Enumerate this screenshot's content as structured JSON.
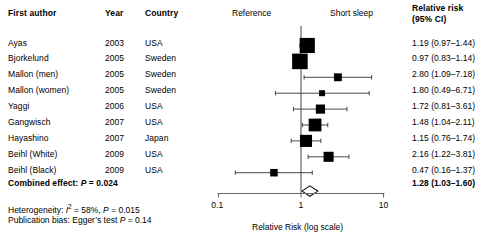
{
  "columns": {
    "author": "First author",
    "year": "Year",
    "country": "Country",
    "risk_line1": "Relative risk",
    "risk_line2": "(95% CI)"
  },
  "plot": {
    "left_label": "Reference",
    "right_label": "Short sleep",
    "axis_label": "Relative Risk (log scale)",
    "ticks": [
      "0.1",
      "1",
      "10"
    ],
    "null_value": 1
  },
  "rows": [
    {
      "author": "Ayas",
      "year": "2003",
      "country": "USA",
      "rr_text": "1.19 (0.97–1.44)",
      "rr": 1.19,
      "lo": 0.97,
      "hi": 1.44,
      "weight": 20.5
    },
    {
      "author": "Bjorkelund",
      "year": "2005",
      "country": "Sweden",
      "rr_text": "0.97 (0.83–1.14)",
      "rr": 0.97,
      "lo": 0.83,
      "hi": 1.14,
      "weight": 21.5
    },
    {
      "author": "Mallon (men)",
      "year": "2005",
      "country": "Sweden",
      "rr_text": "2.80 (1.09–7.18)",
      "rr": 2.8,
      "lo": 1.09,
      "hi": 7.18,
      "weight": 5.5
    },
    {
      "author": "Mallon (women)",
      "year": "2005",
      "country": "Sweden",
      "rr_text": "1.80 (0.49–6.71)",
      "rr": 1.8,
      "lo": 0.49,
      "hi": 6.71,
      "weight": 3.2
    },
    {
      "author": "Yaggi",
      "year": "2006",
      "country": "USA",
      "rr_text": "1.72 (0.81–3.61)",
      "rr": 1.72,
      "lo": 0.81,
      "hi": 3.61,
      "weight": 7.5
    },
    {
      "author": "Gangwisch",
      "year": "2007",
      "country": "USA",
      "rr_text": "1.48 (1.04–2.11)",
      "rr": 1.48,
      "lo": 1.04,
      "hi": 2.11,
      "weight": 14.5
    },
    {
      "author": "Hayashino",
      "year": "2007",
      "country": "Japan",
      "rr_text": "1.15 (0.76–1.74)",
      "rr": 1.15,
      "lo": 0.76,
      "hi": 1.74,
      "weight": 13.0
    },
    {
      "author": "Beihl (White)",
      "year": "2009",
      "country": "USA",
      "rr_text": "2.16 (1.22–3.81)",
      "rr": 2.16,
      "lo": 1.22,
      "hi": 3.81,
      "weight": 9.0
    },
    {
      "author": "Beihl (Black)",
      "year": "2009",
      "country": "USA",
      "rr_text": "0.47 (0.16–1.37)",
      "rr": 0.47,
      "lo": 0.16,
      "hi": 1.37,
      "weight": 5.0
    }
  ],
  "summary": {
    "label": "Combined effect:",
    "p_symbol": "P",
    "p_text": " = 0.024",
    "rr_text": "1.28 (1.03–1.60)",
    "rr": 1.28,
    "lo": 1.03,
    "hi": 1.6
  },
  "footnotes": {
    "heterogeneity_prefix": "Heterogeneity: ",
    "heterogeneity_i": "I",
    "heterogeneity_sup": "2",
    "heterogeneity_mid": " = 58%, ",
    "heterogeneity_p": "P",
    "heterogeneity_tail": " = 0.015",
    "publication_prefix": "Publication bias: Egger’s test ",
    "publication_p": "P",
    "publication_tail": " = 0.14"
  },
  "chart_data": {
    "type": "scatter",
    "title": "",
    "xlabel": "Relative Risk (log scale)",
    "ylabel": "",
    "xscale": "log",
    "xlim": [
      0.1,
      10
    ],
    "xticks": [
      0.1,
      1,
      10
    ],
    "grid": false,
    "reference_line": 1,
    "categories": [
      "Ayas",
      "Bjorkelund",
      "Mallon (men)",
      "Mallon (women)",
      "Yaggi",
      "Gangwisch",
      "Hayashino",
      "Beihl (White)",
      "Beihl (Black)"
    ],
    "values": [
      1.19,
      0.97,
      2.8,
      1.8,
      1.72,
      1.48,
      1.15,
      2.16,
      0.47
    ],
    "ci_low": [
      0.97,
      0.83,
      1.09,
      0.49,
      0.81,
      1.04,
      0.76,
      1.22,
      0.16
    ],
    "ci_high": [
      1.44,
      1.14,
      7.18,
      6.71,
      3.61,
      2.11,
      1.74,
      3.81,
      1.37
    ],
    "pooled": {
      "value": 1.28,
      "ci_low": 1.03,
      "ci_high": 1.6,
      "p": 0.024
    },
    "heterogeneity": {
      "i_squared": "58%",
      "p": 0.015
    },
    "publication_bias": {
      "test": "Egger",
      "p": 0.14
    }
  }
}
